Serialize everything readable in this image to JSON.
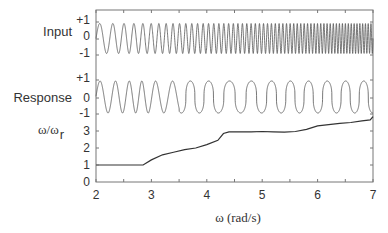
{
  "chart_data": {
    "type": "line",
    "title": "",
    "xlabel": "ω  (rad/s)",
    "xlim": [
      2,
      7
    ],
    "xticks": [
      "2",
      "3",
      "4",
      "5",
      "6",
      "7"
    ],
    "grid": false,
    "legend": null,
    "panels": [
      {
        "name": "Input",
        "ylabel": "Input",
        "yticks": [
          "+1",
          "0",
          "-1"
        ],
        "ylim": [
          -1,
          1
        ],
        "description": "Unit-amplitude chirp (swept sine) whose frequency increases from 2 to 7 rad/s",
        "series": [
          {
            "name": "Input",
            "kind": "chirp",
            "amplitude": 1,
            "omega_start": 2,
            "omega_end": 7
          }
        ]
      },
      {
        "name": "Response",
        "ylabel": "Response",
        "yticks": [
          "+1",
          "0",
          "-1"
        ],
        "ylim": [
          -1,
          1
        ],
        "description": "Entrained oscillator response; sinusoidal at low omega, becoming square-ish/flattened pulses at higher omega",
        "series": [
          {
            "name": "Response",
            "kind": "oscillation",
            "amplitude": 1
          }
        ]
      },
      {
        "name": "FrequencyRatio",
        "ylabel": "ω/ω",
        "ylabel_sub": "r",
        "yticks": [
          "3",
          "2",
          "1",
          "0"
        ],
        "ylim": [
          0,
          3.9
        ],
        "series": [
          {
            "name": "omega/omega_r",
            "x": [
              2.0,
              2.85,
              3.0,
              3.2,
              3.4,
              3.6,
              3.8,
              4.0,
              4.2,
              4.3,
              4.4,
              4.6,
              4.8,
              5.0,
              5.2,
              5.4,
              5.6,
              5.8,
              5.9,
              6.0,
              6.2,
              6.4,
              6.6,
              6.8,
              6.95,
              7.0
            ],
            "values": [
              1.0,
              1.0,
              1.3,
              1.6,
              1.75,
              1.9,
              2.0,
              2.2,
              2.45,
              2.85,
              2.95,
              2.95,
              2.95,
              2.97,
              2.95,
              2.93,
              2.97,
              3.1,
              3.2,
              3.3,
              3.37,
              3.45,
              3.5,
              3.6,
              3.65,
              3.85
            ]
          }
        ]
      }
    ]
  },
  "labels": {
    "input": "Input",
    "response": "Response",
    "ratio": "ω/ω",
    "ratio_sub": "r",
    "xlabel": "ω  (rad/s)",
    "plus1": "+1",
    "zero": "0",
    "minus1": "-1"
  }
}
